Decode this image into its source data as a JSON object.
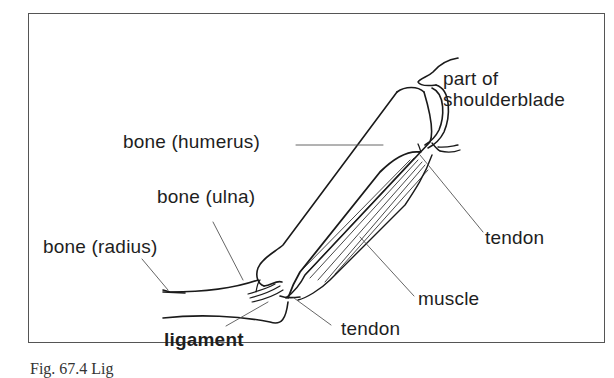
{
  "figure": {
    "labels": {
      "shoulderblade_line1": "part of",
      "shoulderblade_line2": "shoulderblade",
      "humerus": "bone (humerus)",
      "ulna": "bone (ulna)",
      "radius": "bone (radius)",
      "tendon_upper": "tendon",
      "muscle": "muscle",
      "tendon_lower": "tendon",
      "ligament": "ligament"
    },
    "caption_partial": "Fig. 67.4 Lig"
  }
}
